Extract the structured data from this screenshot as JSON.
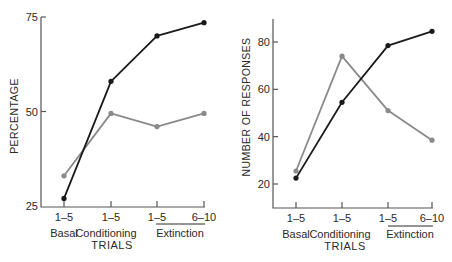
{
  "chart_data": [
    {
      "type": "line",
      "title": "",
      "xlabel": "TRIALS",
      "ylabel": "PERCENTAGE",
      "ylim": [
        25,
        75
      ],
      "yticks": [
        25,
        50,
        75
      ],
      "categories": [
        "1–5",
        "1–5",
        "1–5",
        "6–10"
      ],
      "phase_labels": [
        "Basal",
        "Conditioning",
        "Extinction"
      ],
      "grid": false,
      "legend": null,
      "series": [
        {
          "name": "black series",
          "color": "#1a1a1a",
          "values": [
            27,
            58,
            70,
            73.5
          ]
        },
        {
          "name": "gray series",
          "color": "#8a8a8a",
          "values": [
            33,
            49.5,
            46,
            49.5
          ]
        }
      ]
    },
    {
      "type": "line",
      "title": "",
      "xlabel": "TRIALS",
      "ylabel": "NUMBER OF RESPONSES",
      "ylim": [
        10,
        90
      ],
      "yticks": [
        20,
        40,
        60,
        80
      ],
      "categories": [
        "1–5",
        "1–5",
        "1–5",
        "6–10"
      ],
      "phase_labels": [
        "Basal",
        "Conditioning",
        "Extinction"
      ],
      "grid": false,
      "legend": null,
      "series": [
        {
          "name": "black series",
          "color": "#1a1a1a",
          "values": [
            22.5,
            54.5,
            78.5,
            84.5
          ]
        },
        {
          "name": "gray series",
          "color": "#8a8a8a",
          "values": [
            25.5,
            74,
            51,
            38.5
          ]
        }
      ]
    }
  ]
}
